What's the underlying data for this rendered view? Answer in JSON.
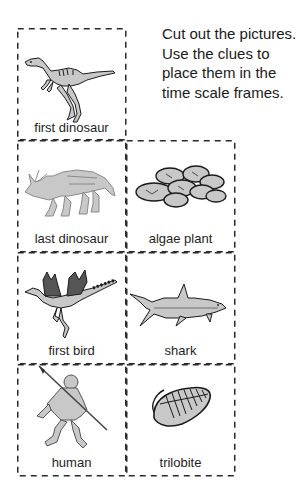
{
  "instructions": {
    "lines": [
      "Cut out the pictures.",
      "Use the clues to",
      "place them in the",
      "time scale frames."
    ]
  },
  "cards": [
    {
      "label": "first dinosaur",
      "icon": "dinosaur-icon"
    },
    {
      "label": "last dinosaur",
      "icon": "triceratops-icon"
    },
    {
      "label": "algae plant",
      "icon": "algae-icon"
    },
    {
      "label": "first bird",
      "icon": "bird-icon"
    },
    {
      "label": "shark",
      "icon": "shark-icon"
    },
    {
      "label": "human",
      "icon": "human-icon"
    },
    {
      "label": "trilobite",
      "icon": "trilobite-icon"
    }
  ],
  "colors": {
    "dash": "#2a2a2a",
    "fill": "#c8c8c8",
    "outline": "#1a1a1a"
  }
}
